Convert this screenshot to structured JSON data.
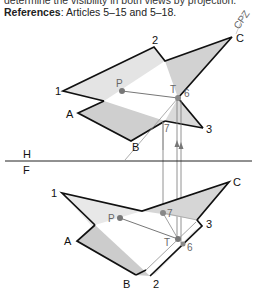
{
  "text": {
    "cut_line": "determine the visibility in both views by projection.",
    "references_label": "References",
    "references_text": ": Articles 5–15 and 5–18.",
    "initials": "CPZ"
  },
  "fold_line": {
    "upper": "H",
    "lower": "F"
  },
  "top_view": {
    "labels": {
      "v1": "1",
      "v2": "2",
      "v3": "3",
      "A": "A",
      "B": "B",
      "C": "C",
      "P": "P",
      "T": "T",
      "six": "6",
      "seven": "7"
    }
  },
  "front_view": {
    "labels": {
      "v1": "1",
      "v2": "2",
      "v3": "3",
      "A": "A",
      "B": "B",
      "C": "C",
      "P": "P",
      "T": "T",
      "six": "6",
      "seven": "7"
    }
  },
  "colors": {
    "outline": "#111111",
    "shade_light": "#dcdcdc",
    "shade_dark": "#c4c4c4",
    "construction": "#777777",
    "point": "#777777"
  }
}
